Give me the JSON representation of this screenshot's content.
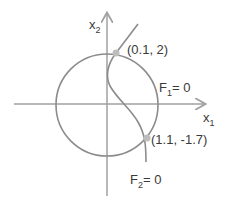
{
  "axes": {
    "x_label": "x",
    "x_sub": "1",
    "y_label": "x",
    "y_sub": "2"
  },
  "curves": {
    "f1_label": "F",
    "f1_sub": "1",
    "f1_eq": "= 0",
    "f2_label": "F",
    "f2_sub": "2",
    "f2_eq": "= 0"
  },
  "points": [
    {
      "label": "(0.1, 2)"
    },
    {
      "label": "(1.1, -1.7)"
    }
  ],
  "colors": {
    "stroke": "#8c8c8c",
    "axis": "#a0a0a0",
    "point": "#bdbdbd",
    "text": "#3a3a3a"
  }
}
